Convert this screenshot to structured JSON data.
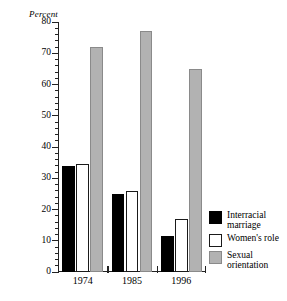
{
  "chart_data": {
    "type": "bar",
    "title": "",
    "subtitle": "",
    "xlabel": "",
    "ylabel": "Percent",
    "categories": [
      "1974",
      "1985",
      "1996"
    ],
    "series": [
      {
        "name": "Interracial\nmarriage",
        "key": "interracial-marriage",
        "color": "#000000",
        "values": [
          34,
          25,
          11.5
        ]
      },
      {
        "name": "Women's role",
        "key": "womens-role",
        "color": "#ffffff",
        "values": [
          34.5,
          26,
          17
        ]
      },
      {
        "name": "Sexual\norientation",
        "key": "sexual-orientation",
        "color": "#b2b2b2",
        "values": [
          72,
          77,
          65
        ]
      }
    ],
    "ylim": [
      0,
      80
    ],
    "ymajor_ticks": [
      0,
      10,
      20,
      30,
      40,
      50,
      60,
      70,
      80
    ],
    "ytick_labels": [
      "0",
      "10",
      "20",
      "30",
      "40",
      "50",
      "60",
      "70",
      "80"
    ],
    "yminor_tick_step": 2,
    "grid": false,
    "legend_position": "right"
  },
  "legend": {
    "items": [
      {
        "label": "Interracial\nmarriage",
        "swatch": "black"
      },
      {
        "label": "Women's role",
        "swatch": "white"
      },
      {
        "label": "Sexual\norientation",
        "swatch": "gray"
      }
    ]
  },
  "axis": {
    "y_title": "Percent"
  }
}
